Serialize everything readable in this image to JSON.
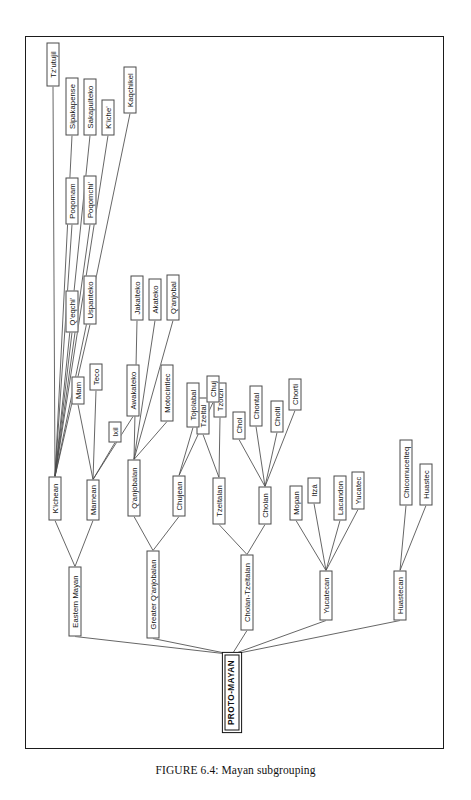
{
  "figure": {
    "caption": "FIGURE 6.4: Mayan subgrouping",
    "caption_label": "FIGURE 6.4:",
    "caption_title": "Mayan subgrouping",
    "orientation": "rotated-90-ccw",
    "frame_color": "#1b1b1b",
    "node_border_color": "#4a4a4a",
    "edge_color": "#4a4a4a",
    "background": "#ffffff"
  },
  "tree": {
    "root": {
      "id": "proto-mayan",
      "label": "PROTO-MAYAN"
    },
    "nodes": [
      {
        "id": "proto-mayan",
        "label": "PROTO-MAYAN",
        "x": 18,
        "y": 198,
        "w": 76,
        "level": 0,
        "root": true
      },
      {
        "id": "huastecan",
        "label": "Huastecan",
        "x": 128,
        "y": 367,
        "w": 50,
        "level": 1
      },
      {
        "id": "huastec",
        "label": "Huastec",
        "x": 243,
        "y": 393,
        "w": 42,
        "level": 2
      },
      {
        "id": "chicomucelteq",
        "label": "Chicomucelteq",
        "x": 243,
        "y": 373,
        "w": 66,
        "level": 2
      },
      {
        "id": "yucatecan",
        "label": "Yucatecan",
        "x": 128,
        "y": 293,
        "w": 50,
        "level": 1
      },
      {
        "id": "mopan",
        "label": "Mopan",
        "x": 228,
        "y": 263,
        "w": 35,
        "level": 2
      },
      {
        "id": "itza",
        "label": "Itzá",
        "x": 245,
        "y": 281,
        "w": 26,
        "level": 2
      },
      {
        "id": "yucatec",
        "label": "Yucatec",
        "x": 239,
        "y": 325,
        "w": 38,
        "level": 2
      },
      {
        "id": "lacandon",
        "label": "Lacandon",
        "x": 228,
        "y": 307,
        "w": 45,
        "level": 2
      },
      {
        "id": "cholan-tzeltalan",
        "label": "Cholan-Tzeltalan",
        "x": 118,
        "y": 214,
        "w": 76,
        "level": 1
      },
      {
        "id": "tzeltalan",
        "label": "Tzeltalan",
        "x": 224,
        "y": 186,
        "w": 47,
        "level": 2
      },
      {
        "id": "tzeltal",
        "label": "Tzeltal",
        "x": 314,
        "y": 170,
        "w": 37,
        "level": 3
      },
      {
        "id": "tzotzil",
        "label": "Tzotzil",
        "x": 331,
        "y": 187,
        "w": 35,
        "level": 3
      },
      {
        "id": "cholan",
        "label": "Cholan",
        "x": 224,
        "y": 232,
        "w": 38,
        "level": 2
      },
      {
        "id": "chol",
        "label": "Chol",
        "x": 309,
        "y": 206,
        "w": 28,
        "level": 3
      },
      {
        "id": "chontal",
        "label": "Chontal",
        "x": 322,
        "y": 223,
        "w": 41,
        "level": 3
      },
      {
        "id": "chorti",
        "label": "Chorti",
        "x": 338,
        "y": 262,
        "w": 32,
        "level": 3
      },
      {
        "id": "cholti",
        "label": "Cholti",
        "x": 316,
        "y": 244,
        "w": 32,
        "level": 3
      },
      {
        "id": "greater-qanjobalan",
        "label": "Greater Q'anjobalan",
        "x": 110,
        "y": 120,
        "w": 88,
        "level": 1
      },
      {
        "id": "qanjobalan",
        "label": "Q'anjobalan",
        "x": 232,
        "y": 101,
        "w": 57,
        "level": 2
      },
      {
        "id": "motocintlec",
        "label": "Motocintlec",
        "x": 327,
        "y": 134,
        "w": 57,
        "level": 3
      },
      {
        "id": "jakalteko",
        "label": "Jakalteko",
        "x": 428,
        "y": 104,
        "w": 45,
        "level": 3
      },
      {
        "id": "akateko",
        "label": "Akateko",
        "x": 428,
        "y": 122,
        "w": 42,
        "level": 3
      },
      {
        "id": "qanjobal",
        "label": "Q'anjobal",
        "x": 428,
        "y": 140,
        "w": 46,
        "level": 3
      },
      {
        "id": "chujean",
        "label": "Chujean",
        "x": 232,
        "y": 146,
        "w": 41,
        "level": 2
      },
      {
        "id": "tojolabal",
        "label": "Tojolabal",
        "x": 321,
        "y": 160,
        "w": 45,
        "level": 3
      },
      {
        "id": "chuj",
        "label": "Chuj",
        "x": 346,
        "y": 180,
        "w": 27,
        "level": 3
      },
      {
        "id": "eastern-mayan",
        "label": "Eastern Mayan",
        "x": 112,
        "y": 42,
        "w": 70,
        "level": 1
      },
      {
        "id": "kichean",
        "label": "K'ichean",
        "x": 228,
        "y": 22,
        "w": 44,
        "level": 2
      },
      {
        "id": "qeqchi",
        "label": "Q'eqchi'",
        "x": 416,
        "y": 39,
        "w": 42,
        "level": 3
      },
      {
        "id": "uspanteko",
        "label": "Uspanteko",
        "x": 424,
        "y": 57,
        "w": 49,
        "level": 3
      },
      {
        "id": "poqomam",
        "label": "Poqomam",
        "x": 524,
        "y": 39,
        "w": 47,
        "level": 4
      },
      {
        "id": "poqomchi",
        "label": "Poqomchi'",
        "x": 524,
        "y": 57,
        "w": 49,
        "level": 4
      },
      {
        "id": "sipakapense",
        "label": "Sipakapense",
        "x": 613,
        "y": 39,
        "w": 58,
        "level": 4
      },
      {
        "id": "sakapulteko",
        "label": "Sakapulteko",
        "x": 613,
        "y": 57,
        "w": 57,
        "level": 4
      },
      {
        "id": "kiche",
        "label": "K'iche'",
        "x": 613,
        "y": 75,
        "w": 36,
        "level": 4
      },
      {
        "id": "kaqchikel",
        "label": "Kaqchikel",
        "x": 635,
        "y": 97,
        "w": 47,
        "level": 4
      },
      {
        "id": "tzutujil",
        "label": "Tz'utujil",
        "x": 662,
        "y": 20,
        "w": 44,
        "level": 4
      },
      {
        "id": "mamean",
        "label": "Mamean",
        "x": 228,
        "y": 60,
        "w": 41,
        "level": 2
      },
      {
        "id": "mam",
        "label": "Mam",
        "x": 344,
        "y": 45,
        "w": 28,
        "level": 3
      },
      {
        "id": "teco",
        "label": "Teco",
        "x": 358,
        "y": 63,
        "w": 27,
        "level": 3
      },
      {
        "id": "ixil",
        "label": "Ixil",
        "x": 306,
        "y": 82,
        "w": 21,
        "level": 3
      },
      {
        "id": "awakateko",
        "label": "Awakateko",
        "x": 332,
        "y": 100,
        "w": 52,
        "level": 3
      }
    ],
    "edges": [
      [
        "proto-mayan",
        "huastecan"
      ],
      [
        "proto-mayan",
        "yucatecan"
      ],
      [
        "proto-mayan",
        "cholan-tzeltalan"
      ],
      [
        "proto-mayan",
        "greater-qanjobalan"
      ],
      [
        "proto-mayan",
        "eastern-mayan"
      ],
      [
        "huastecan",
        "huastec"
      ],
      [
        "huastecan",
        "chicomucelteq"
      ],
      [
        "yucatecan",
        "mopan"
      ],
      [
        "yucatecan",
        "itza"
      ],
      [
        "yucatecan",
        "yucatec"
      ],
      [
        "yucatecan",
        "lacandon"
      ],
      [
        "cholan-tzeltalan",
        "tzeltalan"
      ],
      [
        "cholan-tzeltalan",
        "cholan"
      ],
      [
        "tzeltalan",
        "tzeltal"
      ],
      [
        "tzeltalan",
        "tzotzil"
      ],
      [
        "cholan",
        "chol"
      ],
      [
        "cholan",
        "chontal"
      ],
      [
        "cholan",
        "cholti"
      ],
      [
        "cholan",
        "chorti"
      ],
      [
        "greater-qanjobalan",
        "qanjobalan"
      ],
      [
        "greater-qanjobalan",
        "chujean"
      ],
      [
        "qanjobalan",
        "motocintlec"
      ],
      [
        "qanjobalan",
        "jakalteko"
      ],
      [
        "qanjobalan",
        "akateko"
      ],
      [
        "qanjobalan",
        "qanjobal"
      ],
      [
        "chujean",
        "tojolabal"
      ],
      [
        "chujean",
        "chuj"
      ],
      [
        "eastern-mayan",
        "kichean"
      ],
      [
        "eastern-mayan",
        "mamean"
      ],
      [
        "kichean",
        "qeqchi"
      ],
      [
        "kichean",
        "uspanteko"
      ],
      [
        "kichean",
        "poqomam"
      ],
      [
        "kichean",
        "poqomchi"
      ],
      [
        "kichean",
        "sipakapense"
      ],
      [
        "kichean",
        "sakapulteko"
      ],
      [
        "kichean",
        "kiche"
      ],
      [
        "kichean",
        "kaqchikel"
      ],
      [
        "kichean",
        "tzutujil"
      ],
      [
        "mamean",
        "mam"
      ],
      [
        "mamean",
        "teco"
      ],
      [
        "mamean",
        "ixil"
      ],
      [
        "mamean",
        "awakateko"
      ]
    ]
  }
}
